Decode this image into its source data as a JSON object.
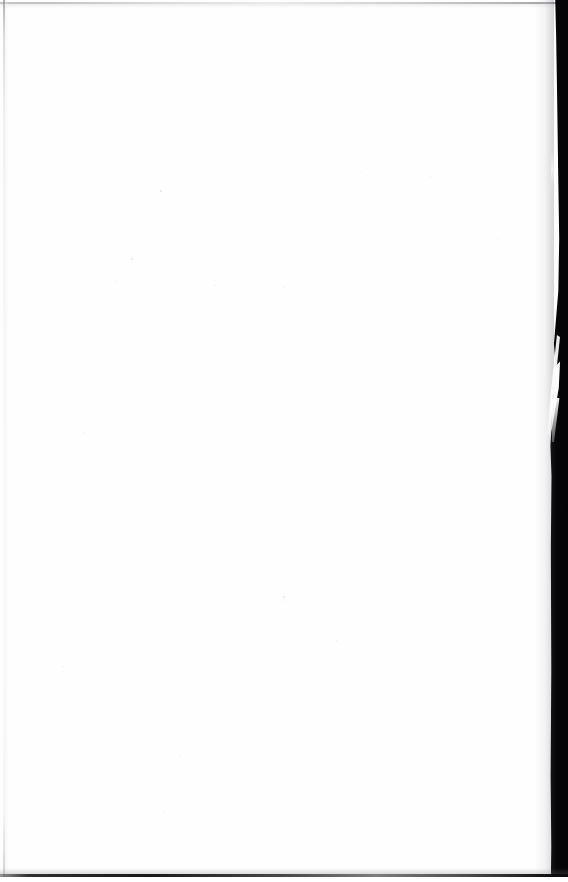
{
  "document": {
    "kind": "scanned-page",
    "page_content_text": "",
    "page_state_label": "blank",
    "width_px": 568,
    "height_px": 882
  },
  "colors": {
    "paper": "#fefefe",
    "page_background": "#ffffff",
    "gutter_shadow": "#060608",
    "bottom_edge_line": "#121214",
    "top_edge_line": "#a8a8aa",
    "left_edge_line": "#8a8a8e",
    "speck": "#a8a8ac"
  },
  "artifacts": [
    {
      "name": "top-scan-edge-line",
      "description": "faint gray horizontal line across the top of the scan",
      "x": 0,
      "y": 2,
      "width": 568,
      "height": 2
    },
    {
      "name": "left-scan-edge-line",
      "description": "faint light-gray vertical rule just inside the left margin",
      "x": 3,
      "y": 0,
      "width": 2,
      "height": 882
    },
    {
      "name": "bottom-scan-edge-line",
      "description": "dark horizontal line along the bottom of the scan",
      "x": 0,
      "y": 874,
      "width": 568,
      "height": 3
    },
    {
      "name": "right-gutter-shadow-band",
      "description": "black vertical band along the right edge (book gutter / spine shadow)",
      "x": 546,
      "y": 0,
      "width": 22,
      "height": 882
    },
    {
      "name": "gutter-tear-sliver",
      "description": "diagonal white sliver cutting into the dark gutter band",
      "x": 546,
      "y": 335,
      "width": 14,
      "height": 100
    }
  ],
  "specks": [
    {
      "x": 160,
      "y": 190,
      "size": 2
    },
    {
      "x": 131,
      "y": 258,
      "size": 2
    },
    {
      "x": 116,
      "y": 281,
      "size": 1
    },
    {
      "x": 215,
      "y": 285,
      "size": 1
    },
    {
      "x": 283,
      "y": 287,
      "size": 1
    },
    {
      "x": 361,
      "y": 172,
      "size": 1
    },
    {
      "x": 430,
      "y": 176,
      "size": 1
    },
    {
      "x": 283,
      "y": 596,
      "size": 2
    },
    {
      "x": 285,
      "y": 600,
      "size": 1
    },
    {
      "x": 179,
      "y": 756,
      "size": 1
    },
    {
      "x": 163,
      "y": 811,
      "size": 1
    },
    {
      "x": 336,
      "y": 640,
      "size": 1
    },
    {
      "x": 83,
      "y": 432,
      "size": 1
    },
    {
      "x": 497,
      "y": 238,
      "size": 1
    },
    {
      "x": 63,
      "y": 666,
      "size": 1
    }
  ]
}
